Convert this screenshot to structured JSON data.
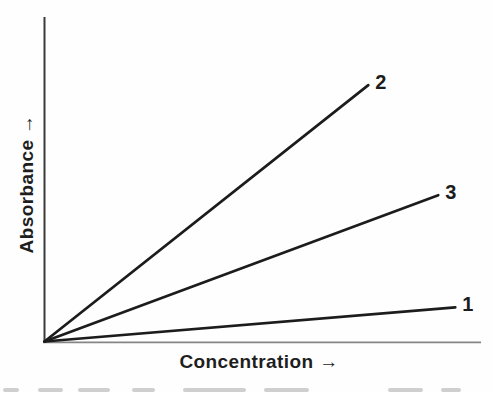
{
  "figure": {
    "xlabel": "Concentration →",
    "ylabel": "Absorbance →",
    "background": "#fefefe",
    "y_axis_color": "#3a3a3a",
    "x_axis_color": "#858585",
    "line_color": "#1c1c1c",
    "label_color": "#1e1e1e"
  },
  "chart_data": {
    "type": "line",
    "title": "",
    "xlabel": "Concentration",
    "ylabel": "Absorbance",
    "x_axis_arrow": "→",
    "y_axis_arrow": "→",
    "axis_ranges": {
      "x": [
        0,
        1
      ],
      "y": [
        0,
        1
      ]
    },
    "ticks": "none",
    "grid": false,
    "legend": "labels at line ends",
    "series": [
      {
        "label": "2",
        "start": [
          0,
          0
        ],
        "end": [
          0.741,
          0.79
        ],
        "slope": 1.07,
        "rank": "steepest"
      },
      {
        "label": "3",
        "start": [
          0,
          0
        ],
        "end": [
          0.901,
          0.451
        ],
        "slope": 0.5,
        "rank": "middle"
      },
      {
        "label": "1",
        "start": [
          0,
          0
        ],
        "end": [
          0.94,
          0.105
        ],
        "slope": 0.11,
        "rank": "shallowest"
      }
    ]
  },
  "artifacts": {
    "smudges": [
      {
        "x": 3,
        "w": 16
      },
      {
        "x": 38,
        "w": 25
      },
      {
        "x": 78,
        "w": 32
      },
      {
        "x": 132,
        "w": 23
      },
      {
        "x": 183,
        "w": 63
      },
      {
        "x": 264,
        "w": 45
      },
      {
        "x": 388,
        "w": 35
      },
      {
        "x": 441,
        "w": 20
      }
    ]
  }
}
